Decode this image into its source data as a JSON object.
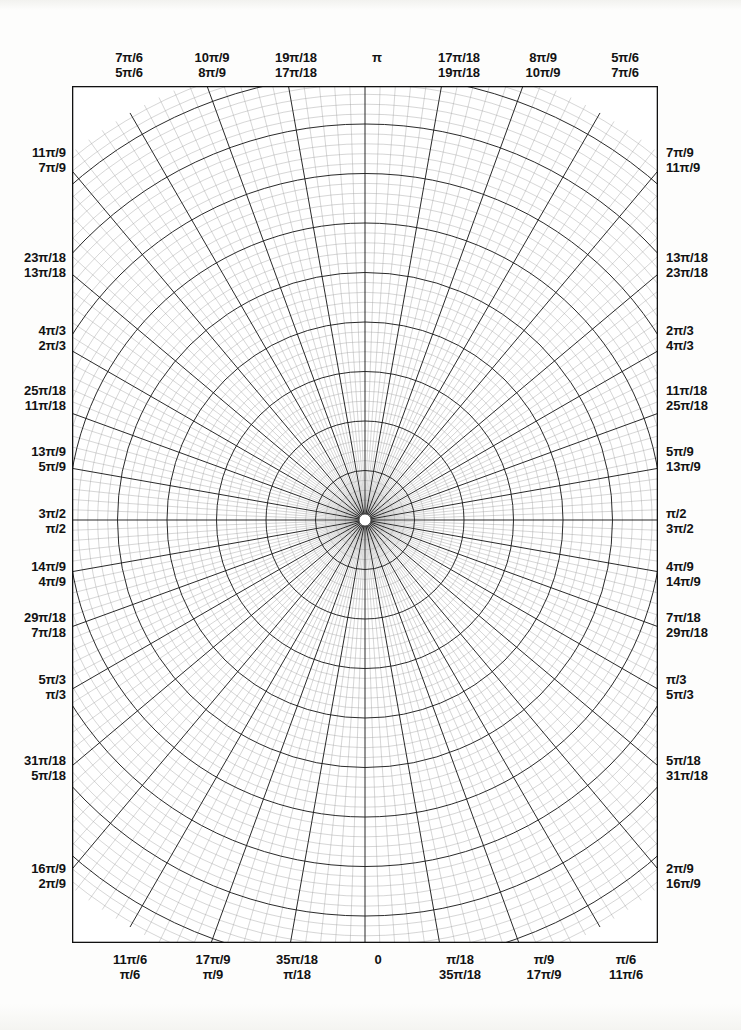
{
  "page": {
    "background_color": "#fdfdfc",
    "ink_color": "#1a1a1a"
  },
  "grid": {
    "center_x": 293,
    "center_y": 434,
    "minor_angle_step_deg": 2,
    "major_angle_step_deg": 10,
    "minor_radius_step": 9.9,
    "major_every_n_rings": 5,
    "inner_blank_radius": 6,
    "max_radius": 470,
    "minor_color": "#8e8e8e",
    "major_color": "#1f1f1f",
    "border_color": "#111111"
  },
  "axis_labels": {
    "top": [
      {
        "x": 129,
        "upper": "7π/6",
        "lower": "5π/6"
      },
      {
        "x": 212,
        "upper": "10π/9",
        "lower": "8π/9"
      },
      {
        "x": 296,
        "upper": "19π/18",
        "lower": "17π/18"
      },
      {
        "x": 377,
        "upper": "",
        "lower": "π"
      },
      {
        "x": 459,
        "upper": "17π/18",
        "lower": "19π/18"
      },
      {
        "x": 543,
        "upper": "8π/9",
        "lower": "10π/9"
      },
      {
        "x": 625,
        "upper": "5π/6",
        "lower": "7π/6"
      }
    ],
    "bottom": [
      {
        "x": 130,
        "upper": "11π/6",
        "lower": "π/6"
      },
      {
        "x": 213,
        "upper": "17π/9",
        "lower": "π/9"
      },
      {
        "x": 297,
        "upper": "35π/18",
        "lower": "π/18"
      },
      {
        "x": 378,
        "upper": "0",
        "lower": ""
      },
      {
        "x": 460,
        "upper": "π/18",
        "lower": "35π/18"
      },
      {
        "x": 544,
        "upper": "π/9",
        "lower": "17π/9"
      },
      {
        "x": 626,
        "upper": "π/6",
        "lower": "11π/6"
      }
    ],
    "left": [
      {
        "y": 160,
        "upper": "11π/9",
        "lower": "7π/9"
      },
      {
        "y": 265,
        "upper": "23π/18",
        "lower": "13π/18"
      },
      {
        "y": 338,
        "upper": "4π/3",
        "lower": "2π/3"
      },
      {
        "y": 398,
        "upper": "25π/18",
        "lower": "11π/18"
      },
      {
        "y": 459,
        "upper": "13π/9",
        "lower": "5π/9"
      },
      {
        "y": 521,
        "upper": "3π/2",
        "lower": "π/2"
      },
      {
        "y": 574,
        "upper": "14π/9",
        "lower": "4π/9"
      },
      {
        "y": 625,
        "upper": "29π/18",
        "lower": "7π/18"
      },
      {
        "y": 687,
        "upper": "5π/3",
        "lower": "π/3"
      },
      {
        "y": 768,
        "upper": "31π/18",
        "lower": "5π/18"
      },
      {
        "y": 876,
        "upper": "16π/9",
        "lower": "2π/9"
      }
    ],
    "right": [
      {
        "y": 160,
        "upper": "7π/9",
        "lower": "11π/9"
      },
      {
        "y": 265,
        "upper": "13π/18",
        "lower": "23π/18"
      },
      {
        "y": 338,
        "upper": "2π/3",
        "lower": "4π/3"
      },
      {
        "y": 398,
        "upper": "11π/18",
        "lower": "25π/18"
      },
      {
        "y": 459,
        "upper": "5π/9",
        "lower": "13π/9"
      },
      {
        "y": 521,
        "upper": "π/2",
        "lower": "3π/2"
      },
      {
        "y": 574,
        "upper": "4π/9",
        "lower": "14π/9"
      },
      {
        "y": 625,
        "upper": "7π/18",
        "lower": "29π/18"
      },
      {
        "y": 687,
        "upper": "π/3",
        "lower": "5π/3"
      },
      {
        "y": 768,
        "upper": "5π/18",
        "lower": "31π/18"
      },
      {
        "y": 876,
        "upper": "2π/9",
        "lower": "16π/9"
      }
    ]
  }
}
